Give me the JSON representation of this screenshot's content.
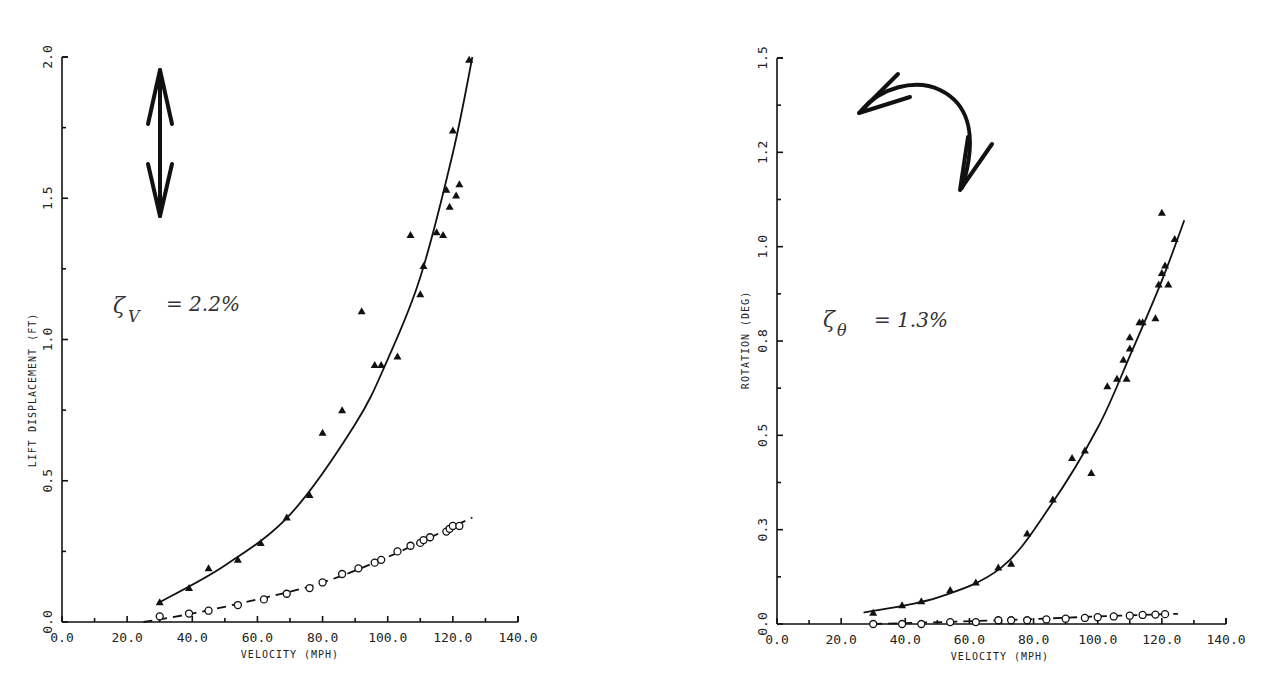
{
  "chart_data": [
    {
      "type": "scatter",
      "title": "",
      "xlabel": "VELOCITY (MPH)",
      "ylabel": "LIFT DISPLACEMENT (FT)",
      "xlim": [
        0,
        140
      ],
      "ylim": [
        0,
        2.0
      ],
      "x_ticks": [
        "0.0",
        "20.0",
        "40.0",
        "60.0",
        "80.0",
        "100.0",
        "120.0",
        "140.0"
      ],
      "y_ticks": [
        "0.0",
        "0.5",
        "1.0",
        "1.5",
        "2.0"
      ],
      "grid": false,
      "annotation": {
        "symbol": "ζ",
        "subscript": "V",
        "text": "= 2.2%"
      },
      "icon": "vertical-double-arrow",
      "series": [
        {
          "name": "Lift displacement (triangles, solid fit)",
          "marker": "triangle",
          "x": [
            30,
            39,
            45,
            54,
            61,
            69,
            76,
            80,
            86,
            92,
            96,
            98,
            103,
            107,
            110,
            111,
            115,
            117,
            118,
            119,
            120,
            121,
            122,
            125
          ],
          "values": [
            0.07,
            0.12,
            0.19,
            0.22,
            0.28,
            0.37,
            0.45,
            0.67,
            0.75,
            1.1,
            0.91,
            0.91,
            0.94,
            1.37,
            1.16,
            1.26,
            1.38,
            1.37,
            1.53,
            1.47,
            1.74,
            1.51,
            1.55,
            1.99
          ],
          "fit": {
            "x": [
              30,
              50,
              70,
              90,
              100,
              110,
              120,
              126
            ],
            "values": [
              0.07,
              0.2,
              0.38,
              0.7,
              0.93,
              1.22,
              1.66,
              2.0
            ]
          }
        },
        {
          "name": "Lift displacement (circles, dashed fit)",
          "marker": "circle-open",
          "x": [
            30,
            39,
            45,
            54,
            62,
            69,
            76,
            80,
            86,
            91,
            96,
            98,
            103,
            107,
            110,
            111,
            113,
            118,
            119,
            120,
            122
          ],
          "values": [
            0.02,
            0.03,
            0.04,
            0.06,
            0.08,
            0.1,
            0.12,
            0.14,
            0.17,
            0.19,
            0.21,
            0.22,
            0.25,
            0.27,
            0.28,
            0.29,
            0.3,
            0.32,
            0.33,
            0.34,
            0.34
          ],
          "fit": {
            "x": [
              25,
              40,
              60,
              80,
              100,
              126
            ],
            "values": [
              0.0,
              0.03,
              0.08,
              0.14,
              0.23,
              0.37
            ]
          }
        }
      ]
    },
    {
      "type": "scatter",
      "title": "",
      "xlabel": "VELOCITY (MPH)",
      "ylabel": "ROTATION (DEG)",
      "xlim": [
        0,
        140
      ],
      "ylim": [
        0,
        1.5
      ],
      "x_ticks": [
        "0.0",
        "20.0",
        "40.0",
        "60.0",
        "80.0",
        "100.0",
        "120.0",
        "140.0"
      ],
      "y_ticks": [
        "0.0",
        "0.3",
        "0.5",
        "0.8",
        "1.0",
        "1.2",
        "1.5"
      ],
      "grid": false,
      "annotation": {
        "symbol": "ζ",
        "subscript": "θ",
        "text": "= 1.3%"
      },
      "icon": "curved-rotation-arrow",
      "series": [
        {
          "name": "Rotation (triangles, solid fit)",
          "marker": "triangle",
          "x": [
            30,
            39,
            45,
            54,
            62,
            69,
            73,
            78,
            86,
            92,
            96,
            98,
            103,
            106,
            108,
            109,
            110,
            110,
            113,
            114,
            118,
            119,
            120,
            120,
            121,
            122,
            124
          ],
          "values": [
            0.03,
            0.05,
            0.06,
            0.09,
            0.11,
            0.15,
            0.16,
            0.24,
            0.33,
            0.44,
            0.46,
            0.4,
            0.63,
            0.65,
            0.7,
            0.65,
            0.73,
            0.76,
            0.8,
            0.8,
            0.81,
            0.9,
            0.93,
            1.09,
            0.95,
            0.9,
            1.02
          ],
          "fit": {
            "x": [
              27,
              50,
              70,
              85,
              100,
              110,
              120,
              127
            ],
            "values": [
              0.03,
              0.07,
              0.15,
              0.31,
              0.52,
              0.71,
              0.91,
              1.07
            ]
          }
        },
        {
          "name": "Rotation (circles, dashed fit)",
          "marker": "circle-open",
          "x": [
            30,
            39,
            45,
            54,
            62,
            69,
            73,
            78,
            84,
            90,
            96,
            100,
            105,
            110,
            114,
            118,
            121
          ],
          "values": [
            0.0,
            0.0,
            0.0,
            0.005,
            0.005,
            0.01,
            0.01,
            0.01,
            0.012,
            0.014,
            0.016,
            0.018,
            0.02,
            0.022,
            0.024,
            0.025,
            0.026
          ],
          "fit": {
            "x": [
              30,
              70,
              100,
              125
            ],
            "values": [
              0.0,
              0.01,
              0.02,
              0.027
            ]
          }
        }
      ]
    }
  ],
  "left_chart": {
    "ylabel": "LIFT DISPLACEMENT (FT)",
    "xlabel": "VELOCITY (MPH)",
    "damping_symbol": "ζ",
    "damping_sub": "V",
    "damping_value": "=  2.2%",
    "x_ticks": [
      "0.0",
      "20.0",
      "40.0",
      "60.0",
      "80.0",
      "100.0",
      "120.0",
      "140.0"
    ],
    "y_ticks": [
      "0.0",
      "0.5",
      "1.0",
      "1.5",
      "2.0"
    ]
  },
  "right_chart": {
    "ylabel": "ROTATION (DEG)",
    "xlabel": "VELOCITY (MPH)",
    "damping_symbol": "ζ",
    "damping_sub": "θ",
    "damping_value": "=  1.3%",
    "x_ticks": [
      "0.0",
      "20.0",
      "40.0",
      "60.0",
      "80.0",
      "100.0",
      "120.0",
      "140.0"
    ],
    "y_ticks": [
      "0.0",
      "0.3",
      "0.5",
      "0.8",
      "1.0",
      "1.2",
      "1.5"
    ]
  }
}
